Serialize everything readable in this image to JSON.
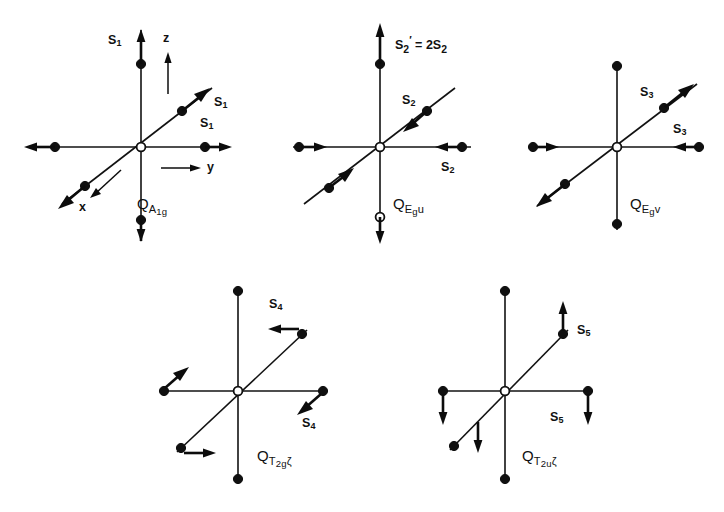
{
  "figure": {
    "background_color": "#ffffff",
    "ink_color": "#111111",
    "panel_count": 5
  },
  "axes": {
    "z_label": "z",
    "y_label": "y",
    "x_label": "x"
  },
  "panels": [
    {
      "id": "panel-a1g",
      "mode_label_q": "Q",
      "mode_label_sub_main": "A",
      "mode_label_sub_deep": "1g",
      "mode_label_plain": "Q_A1g",
      "stretch_labels": [
        "S",
        "S",
        "S"
      ],
      "stretch_sub": "1",
      "vertex_labels": {
        "top": "S",
        "upper_right_diagonal": "S",
        "right": "S"
      },
      "has_axes": true,
      "note": ""
    },
    {
      "id": "panel-egu",
      "mode_label_q": "Q",
      "mode_label_sub_main": "E",
      "mode_label_sub_deep": "g",
      "mode_label_tail": "u",
      "mode_label_plain": "Q_Egu",
      "stretch_sub": "2",
      "vertex_labels": {
        "upper_right_diagonal": "S",
        "right": "S"
      },
      "has_axes": false,
      "note": "S'2 = 2S2",
      "note_parts": {
        "lead": "S",
        "lead_sub": "2",
        "prime": "'",
        "equals": " = 2",
        "tail": "S",
        "tail_sub": "2"
      }
    },
    {
      "id": "panel-egv",
      "mode_label_q": "Q",
      "mode_label_sub_main": "E",
      "mode_label_sub_deep": "g",
      "mode_label_tail": "v",
      "mode_label_plain": "Q_Egv",
      "stretch_sub": "3",
      "vertex_labels": {
        "upper_right_diagonal": "S",
        "right": "S"
      },
      "has_axes": false,
      "note": ""
    },
    {
      "id": "panel-t2g",
      "mode_label_q": "Q",
      "mode_label_sub_main": "T",
      "mode_label_sub_deep": "2g",
      "mode_label_tail": "ζ",
      "mode_label_plain": "Q_T2gζ",
      "stretch_sub": "4",
      "vertex_labels": {
        "upper_right_diagonal": "S",
        "right": "S"
      },
      "has_axes": false,
      "note": ""
    },
    {
      "id": "panel-t2u",
      "mode_label_q": "Q",
      "mode_label_sub_main": "T",
      "mode_label_sub_deep": "2u",
      "mode_label_tail": "ζ",
      "mode_label_plain": "Q_T2uζ",
      "stretch_sub": "5",
      "vertex_labels": {
        "upper_right_diagonal": "S",
        "right": "S"
      },
      "has_axes": false,
      "note": ""
    }
  ],
  "symbols": {
    "S": "S",
    "Q": "Q",
    "prime": "′",
    "zeta": "ζ",
    "equals_two": "= 2"
  }
}
